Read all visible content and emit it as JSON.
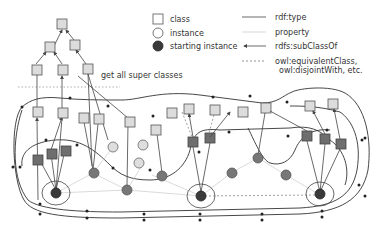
{
  "legend": {
    "nodes": [
      {
        "shape": "square",
        "label": "class"
      },
      {
        "shape": "circle-open",
        "label": "instance"
      },
      {
        "shape": "circle-filled",
        "label": "starting instance"
      }
    ],
    "edges": [
      {
        "style": "solid",
        "label": "rdf:type"
      },
      {
        "style": "light",
        "label": "property"
      },
      {
        "style": "arrow",
        "label": "rdfs:subClassOf"
      },
      {
        "style": "dashed",
        "label_line1": "owl:equivalentClass,",
        "label_line2": "owl:disjointWith, etc."
      }
    ]
  },
  "annotation": {
    "super_classes": "get all super classes"
  },
  "colors": {
    "class_light": "#dcdcdc",
    "class_dark": "#6e6e6e",
    "instance_light": "#dedede",
    "instance_dark": "#777777",
    "starting_instance": "#3a3a3a"
  }
}
